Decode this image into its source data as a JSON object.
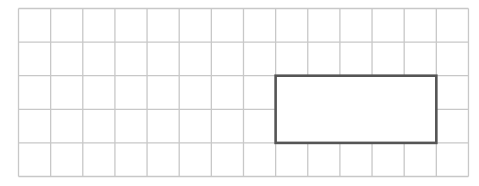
{
  "diagram": {
    "type": "grid-with-highlighted-rectangle",
    "grid": {
      "columns": 14,
      "rows": 5,
      "origin_x": 18.5,
      "origin_y": 8.5,
      "cell_width": 32.14,
      "cell_height": 33.6,
      "line_color": "#c8c8c8",
      "line_width": 1.3
    },
    "rectangle": {
      "col_start": 8,
      "col_end": 13,
      "row_start": 2,
      "row_end": 4,
      "width_cells": 5,
      "height_cells": 2,
      "stroke_color": "#555555",
      "stroke_width": 2.6,
      "fill": "#ffffff"
    }
  }
}
